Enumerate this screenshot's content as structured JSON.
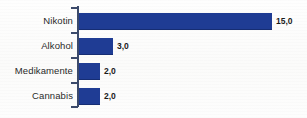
{
  "chart_data": {
    "type": "bar",
    "orientation": "horizontal",
    "title": "",
    "subtitle": "",
    "xlabel": "",
    "ylabel": "",
    "grid": false,
    "legend": false,
    "legend_position": "none",
    "xlim": [
      0,
      15.9
    ],
    "categories": [
      "Nikotin",
      "Alkohol",
      "Medikamente",
      "Cannabis"
    ],
    "values": [
      15.0,
      3.0,
      2.0,
      2.0
    ],
    "value_labels": [
      "15,0",
      "3,0",
      "2,0",
      "2,0"
    ],
    "tick_labels": [],
    "annotations": [],
    "colors": {
      "bar": "#1f3c94",
      "bar_edge": "#162d73",
      "axis": "#3b4a6b",
      "label_text": "#2a2a2a",
      "value_text": "#1a1a1a",
      "background": "#fdfdfc"
    }
  },
  "bars": [
    {
      "label": "Nikotin",
      "value_label": "15,0",
      "width_px": 193,
      "top_px": 13
    },
    {
      "label": "Alkohol",
      "value_label": "3,0",
      "width_px": 34,
      "top_px": 38
    },
    {
      "label": "Medikamente",
      "value_label": "2,0",
      "width_px": 21,
      "top_px": 63
    },
    {
      "label": "Cannabis",
      "value_label": "2,0",
      "width_px": 21,
      "top_px": 88
    }
  ],
  "ticks": [
    {
      "top_px": 7
    },
    {
      "top_px": 32
    },
    {
      "top_px": 57
    },
    {
      "top_px": 82
    },
    {
      "top_px": 106
    }
  ]
}
